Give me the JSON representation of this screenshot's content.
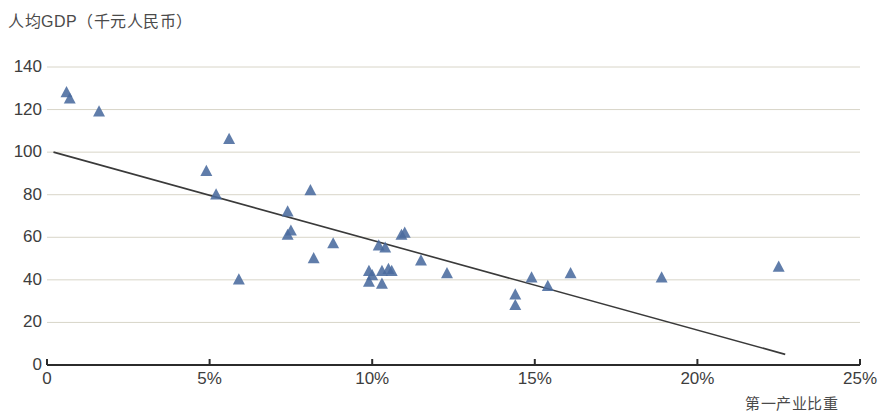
{
  "chart_data": {
    "type": "scatter",
    "title": "",
    "ylabel": "人均GDP（千元人民币）",
    "xlabel": "第一产业比重",
    "xlim": [
      0,
      25
    ],
    "ylim": [
      0,
      140
    ],
    "x_ticks": [
      "0",
      "5%",
      "10%",
      "15%",
      "20%",
      "25%"
    ],
    "x_tick_values": [
      0,
      5,
      10,
      15,
      20,
      25
    ],
    "y_ticks": [
      "0",
      "20",
      "40",
      "60",
      "80",
      "100",
      "120",
      "140"
    ],
    "y_tick_values": [
      0,
      20,
      40,
      60,
      80,
      100,
      120,
      140
    ],
    "grid": "horizontal",
    "legend": "none",
    "marker": "triangle",
    "marker_color": "#4a6b9e",
    "series": [
      {
        "name": "省份",
        "points": [
          [
            0.6,
            128
          ],
          [
            0.7,
            125
          ],
          [
            1.6,
            119
          ],
          [
            5.6,
            106
          ],
          [
            4.9,
            91
          ],
          [
            5.2,
            80
          ],
          [
            8.1,
            82
          ],
          [
            7.4,
            72
          ],
          [
            7.5,
            63
          ],
          [
            7.4,
            61
          ],
          [
            8.8,
            57
          ],
          [
            8.2,
            50
          ],
          [
            5.9,
            40
          ],
          [
            10.2,
            56
          ],
          [
            10.4,
            55
          ],
          [
            11.0,
            62
          ],
          [
            10.9,
            61
          ],
          [
            9.9,
            44
          ],
          [
            10.3,
            44
          ],
          [
            10.5,
            45
          ],
          [
            10.6,
            44
          ],
          [
            10.0,
            42
          ],
          [
            10.3,
            38
          ],
          [
            9.9,
            39
          ],
          [
            11.5,
            49
          ],
          [
            12.3,
            43
          ],
          [
            14.4,
            33
          ],
          [
            14.4,
            28
          ],
          [
            14.9,
            41
          ],
          [
            15.4,
            37
          ],
          [
            16.1,
            43
          ],
          [
            18.9,
            41
          ],
          [
            22.5,
            46
          ]
        ]
      }
    ],
    "trendline": {
      "type": "linear",
      "x_start": 0.2,
      "y_start": 100,
      "x_end": 22.7,
      "y_end": 5,
      "color": "#3a3a3a"
    }
  },
  "axis": {
    "y_title": "人均GDP（千元人民币）",
    "x_title": "第一产业比重"
  }
}
